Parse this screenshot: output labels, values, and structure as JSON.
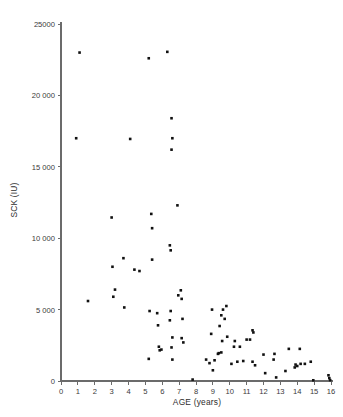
{
  "chart_data": {
    "type": "scatter",
    "title": "",
    "xlabel": "AGE (years)",
    "ylabel": "SCK (IU)",
    "xlim": [
      0,
      16
    ],
    "ylim": [
      0,
      25000
    ],
    "xticks": [
      0,
      1,
      2,
      3,
      4,
      5,
      6,
      7,
      8,
      9,
      10,
      11,
      12,
      13,
      14,
      15,
      16
    ],
    "xticklabels": [
      "0",
      "1",
      "2",
      "3",
      "4",
      "5",
      "6",
      "7",
      "8",
      "9",
      "10",
      "11",
      "12",
      "13",
      "14",
      "15",
      "16"
    ],
    "yticks": [
      0,
      5000,
      10000,
      15000,
      20000,
      25000
    ],
    "yticklabels": [
      "0",
      "5 000",
      "10 000",
      "15 000",
      "20 000",
      "25000"
    ],
    "grid": false,
    "legend": null,
    "marker": "square",
    "marker_color": "#111111",
    "marker_size_px": 2.6,
    "series": [
      {
        "name": "SCK by age",
        "points": [
          [
            1.1,
            23000
          ],
          [
            5.2,
            22600
          ],
          [
            6.3,
            23050
          ],
          [
            0.9,
            17000
          ],
          [
            4.1,
            16950
          ],
          [
            6.55,
            18400
          ],
          [
            6.6,
            17000
          ],
          [
            6.55,
            16200
          ],
          [
            1.6,
            5600
          ],
          [
            3.0,
            11450
          ],
          [
            3.05,
            8000
          ],
          [
            3.2,
            6400
          ],
          [
            3.1,
            5900
          ],
          [
            3.7,
            8600
          ],
          [
            3.75,
            5150
          ],
          [
            4.35,
            7800
          ],
          [
            4.65,
            7700
          ],
          [
            5.35,
            11700
          ],
          [
            5.4,
            10700
          ],
          [
            5.4,
            8500
          ],
          [
            5.25,
            4900
          ],
          [
            5.2,
            1550
          ],
          [
            5.7,
            4750
          ],
          [
            5.75,
            3900
          ],
          [
            5.8,
            2400
          ],
          [
            5.85,
            2150
          ],
          [
            5.95,
            2200
          ],
          [
            6.45,
            9500
          ],
          [
            6.5,
            9150
          ],
          [
            6.5,
            4900
          ],
          [
            6.45,
            4250
          ],
          [
            6.6,
            3050
          ],
          [
            6.55,
            2350
          ],
          [
            6.6,
            1500
          ],
          [
            6.9,
            12300
          ],
          [
            6.95,
            6000
          ],
          [
            7.1,
            6350
          ],
          [
            7.15,
            5750
          ],
          [
            7.2,
            4350
          ],
          [
            7.25,
            2700
          ],
          [
            7.15,
            3000
          ],
          [
            7.8,
            100
          ],
          [
            8.6,
            1500
          ],
          [
            8.8,
            1250
          ],
          [
            8.9,
            3300
          ],
          [
            8.95,
            5000
          ],
          [
            9.0,
            750
          ],
          [
            9.1,
            1450
          ],
          [
            9.3,
            1900
          ],
          [
            9.35,
            1950
          ],
          [
            9.4,
            3850
          ],
          [
            9.5,
            4600
          ],
          [
            9.5,
            2000
          ],
          [
            9.55,
            2800
          ],
          [
            9.6,
            5000
          ],
          [
            9.7,
            4350
          ],
          [
            9.8,
            5250
          ],
          [
            9.85,
            3100
          ],
          [
            10.1,
            1200
          ],
          [
            10.25,
            2400
          ],
          [
            10.3,
            2800
          ],
          [
            10.45,
            1350
          ],
          [
            10.6,
            2400
          ],
          [
            10.8,
            1400
          ],
          [
            11.0,
            2900
          ],
          [
            11.2,
            2900
          ],
          [
            11.35,
            3550
          ],
          [
            11.4,
            3400
          ],
          [
            11.35,
            1350
          ],
          [
            11.5,
            1100
          ],
          [
            12.0,
            1850
          ],
          [
            12.1,
            550
          ],
          [
            12.6,
            1500
          ],
          [
            12.65,
            1900
          ],
          [
            12.75,
            250
          ],
          [
            13.3,
            700
          ],
          [
            13.5,
            2250
          ],
          [
            13.85,
            950
          ],
          [
            13.9,
            1150
          ],
          [
            14.0,
            1050
          ],
          [
            14.15,
            2250
          ],
          [
            14.2,
            1200
          ],
          [
            14.45,
            1200
          ],
          [
            14.8,
            1350
          ],
          [
            14.95,
            50
          ],
          [
            15.85,
            400
          ],
          [
            15.9,
            200
          ],
          [
            15.95,
            60
          ]
        ]
      }
    ]
  },
  "figure": {
    "background_color": "#ffffff",
    "axis_color": "#6b6b6b",
    "text_color": "#3a3a3a"
  }
}
